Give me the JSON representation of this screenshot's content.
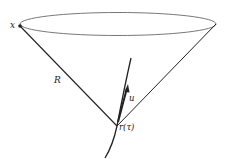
{
  "diagram": {
    "type": "light-cone",
    "colors": {
      "stroke": "#222222",
      "ellipse": "#555555",
      "background": "#ffffff"
    },
    "labels": {
      "point": "x",
      "distance": "R",
      "velocity": "u",
      "position": "r(τ)"
    },
    "elements": [
      {
        "id": "cone-rim",
        "kind": "ellipse",
        "description": "Rim of the past light cone of point x"
      },
      {
        "id": "cone-left-generator",
        "kind": "line",
        "label": "R",
        "description": "Null ray from r(τ) to x"
      },
      {
        "id": "cone-right-generator",
        "kind": "line"
      },
      {
        "id": "worldline",
        "kind": "curve",
        "description": "Particle worldline"
      },
      {
        "id": "velocity-vector",
        "kind": "arrow",
        "label": "u"
      },
      {
        "id": "field-point",
        "kind": "point",
        "label": "x"
      },
      {
        "id": "retarded-point",
        "kind": "point",
        "label": "r(τ)"
      }
    ]
  }
}
